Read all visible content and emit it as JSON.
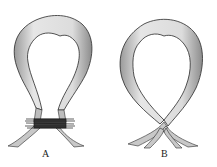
{
  "figure": {
    "panels": [
      {
        "id": "A",
        "label": "A",
        "description": "bowel loop with constricting band at base"
      },
      {
        "id": "B",
        "label": "B",
        "description": "bowel loop twisted at base"
      }
    ],
    "colors": {
      "ink": "#2a2a2a",
      "shade": "#8a8a8a",
      "background": "#ffffff"
    }
  }
}
